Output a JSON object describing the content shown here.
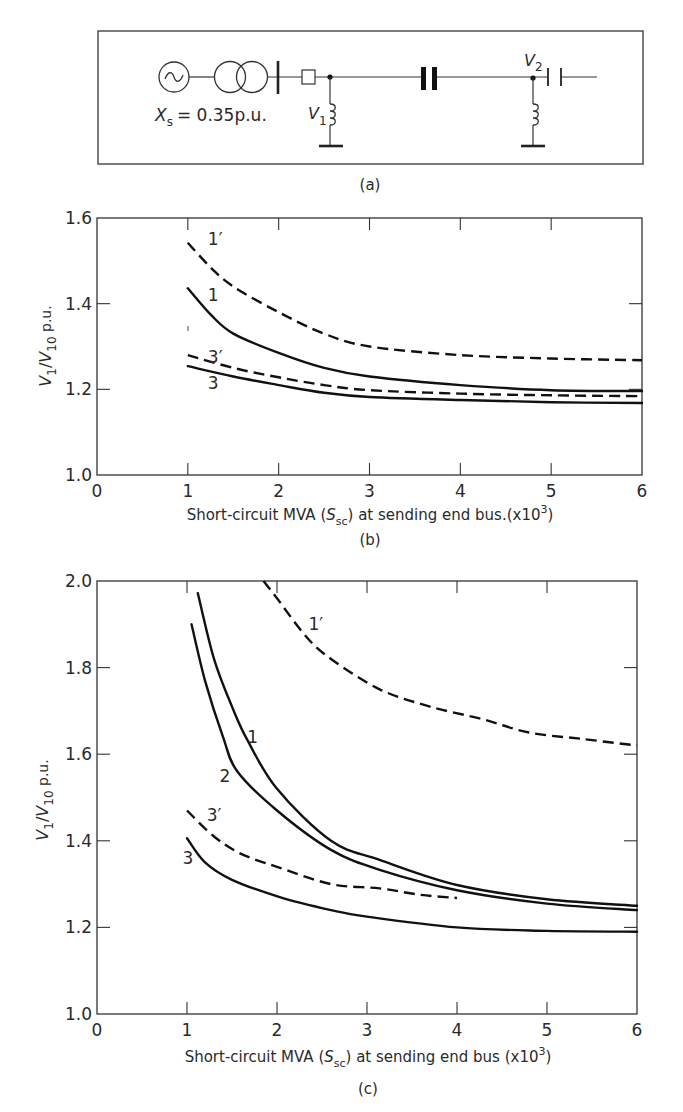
{
  "figure": {
    "panel_a": {
      "caption": "(a)",
      "source_reactance_label": "X",
      "source_reactance_sub": "s",
      "source_reactance_value": "= 0.35p.u.",
      "node1_label": "V",
      "node1_sub": "1",
      "node2_label": "V",
      "node2_sub": "2",
      "components": [
        "ac-generator",
        "two-winding-transformer",
        "bus-bar",
        "circuit-breaker",
        "shunt-reactor-at-V1",
        "series-capacitor",
        "shunt-reactor-at-V2",
        "shunt-capacitor-at-V2"
      ]
    }
  },
  "chart_data": [
    {
      "id": "b",
      "type": "line",
      "caption": "(b)",
      "title": "",
      "xlabel": "Short-circuit MVA (S_sc) at sending end bus.(x10^3)",
      "xlabel_parts": {
        "pre": "Short-circuit MVA (",
        "s": "S",
        "sub": "sc",
        "post": ") at sending end bus.(x10",
        "sup": "3",
        "end": ")"
      },
      "ylabel": "V1/V10 p.u.",
      "ylabel_parts": {
        "v1": "V",
        "v1sub": "1",
        "slash": "/",
        "v10": "V",
        "v10sub": "10",
        "unit": " p.u."
      },
      "xlim": [
        0,
        6
      ],
      "ylim": [
        1.0,
        1.6
      ],
      "xticks": [
        "0",
        "1",
        "2",
        "3",
        "4",
        "5",
        "6"
      ],
      "yticks": [
        "1.0",
        "1.2",
        "1.4",
        "1.6"
      ],
      "grid": false,
      "series": [
        {
          "name": "1'",
          "style": "dashed",
          "label_at": [
            1.22,
            1.55
          ],
          "x": [
            1.0,
            1.25,
            1.5,
            2.0,
            2.5,
            3.0,
            4.0,
            5.0,
            6.0
          ],
          "y": [
            1.542,
            1.485,
            1.44,
            1.38,
            1.33,
            1.3,
            1.28,
            1.272,
            1.268
          ]
        },
        {
          "name": "1",
          "style": "solid",
          "label_at": [
            1.22,
            1.42
          ],
          "x": [
            1.0,
            1.25,
            1.5,
            2.0,
            2.5,
            3.0,
            4.0,
            5.0,
            6.0
          ],
          "y": [
            1.436,
            1.375,
            1.33,
            1.285,
            1.25,
            1.23,
            1.21,
            1.198,
            1.196
          ]
        },
        {
          "name": "3'",
          "style": "dashed",
          "label_at": [
            1.22,
            1.275
          ],
          "x": [
            1.0,
            1.5,
            2.0,
            2.5,
            3.0,
            4.0,
            5.0,
            6.0
          ],
          "y": [
            1.28,
            1.25,
            1.228,
            1.21,
            1.198,
            1.19,
            1.186,
            1.184
          ]
        },
        {
          "name": "3",
          "style": "solid",
          "label_at": [
            1.22,
            1.215
          ],
          "x": [
            1.0,
            1.5,
            2.0,
            2.5,
            3.0,
            4.0,
            5.0,
            6.0
          ],
          "y": [
            1.254,
            1.23,
            1.21,
            1.192,
            1.182,
            1.175,
            1.17,
            1.168
          ]
        }
      ]
    },
    {
      "id": "c",
      "type": "line",
      "caption": "(c)",
      "title": "",
      "xlabel": "Short-circuit MVA (S_sc) at sending end bus (x10^3)",
      "xlabel_parts": {
        "pre": "Short-circuit MVA (",
        "s": "S",
        "sub": "sc",
        "post": ") at sending end bus (x10",
        "sup": "3",
        "end": ")"
      },
      "ylabel": "V1/V10 p.u.",
      "ylabel_parts": {
        "v1": "V",
        "v1sub": "1",
        "slash": "/",
        "v10": "V",
        "v10sub": "10",
        "unit": " p.u."
      },
      "xlim": [
        0,
        6
      ],
      "ylim": [
        1.0,
        2.0
      ],
      "xticks": [
        "0",
        "1",
        "2",
        "3",
        "4",
        "5",
        "6"
      ],
      "yticks": [
        "1.0",
        "1.2",
        "1.4",
        "1.6",
        "1.8",
        "2.0"
      ],
      "grid": false,
      "series": [
        {
          "name": "1'",
          "style": "dashed",
          "label_at": [
            2.35,
            1.9
          ],
          "x": [
            1.85,
            2.0,
            2.33,
            2.6,
            3.14,
            3.7,
            4.3,
            4.8,
            5.4,
            6.0
          ],
          "y": [
            2.0,
            1.96,
            1.87,
            1.82,
            1.75,
            1.71,
            1.68,
            1.65,
            1.635,
            1.62
          ]
        },
        {
          "name": "1",
          "style": "solid",
          "label_at": [
            1.67,
            1.64
          ],
          "x": [
            1.12,
            1.3,
            1.5,
            1.67,
            2.0,
            2.6,
            3.14,
            4.0,
            5.0,
            6.0
          ],
          "y": [
            1.972,
            1.82,
            1.71,
            1.633,
            1.52,
            1.4,
            1.356,
            1.298,
            1.265,
            1.25
          ]
        },
        {
          "name": "2",
          "style": "solid",
          "label_at": [
            1.36,
            1.55
          ],
          "x": [
            1.05,
            1.2,
            1.4,
            1.56,
            2.0,
            2.6,
            3.14,
            4.0,
            5.0,
            6.0
          ],
          "y": [
            1.9,
            1.77,
            1.64,
            1.56,
            1.47,
            1.379,
            1.333,
            1.286,
            1.255,
            1.24
          ]
        },
        {
          "name": "3'",
          "style": "dashed",
          "label_at": [
            1.22,
            1.46
          ],
          "x": [
            1.0,
            1.3,
            1.6,
            2.0,
            2.6,
            3.14,
            3.6,
            4.0
          ],
          "y": [
            1.47,
            1.41,
            1.37,
            1.34,
            1.3,
            1.29,
            1.275,
            1.268
          ]
        },
        {
          "name": "3",
          "style": "solid",
          "label_at": [
            0.95,
            1.36
          ],
          "x": [
            1.0,
            1.2,
            1.5,
            2.03,
            2.6,
            3.0,
            4.0,
            5.0,
            6.0
          ],
          "y": [
            1.406,
            1.35,
            1.31,
            1.27,
            1.24,
            1.225,
            1.2,
            1.192,
            1.19
          ]
        }
      ]
    }
  ],
  "layout_frames": {
    "b": {
      "x0": 97,
      "x1": 642,
      "ytop": 218,
      "ybot": 475
    },
    "c": {
      "x0": 97,
      "x1": 637,
      "ytop": 581,
      "ybot": 1014
    }
  }
}
